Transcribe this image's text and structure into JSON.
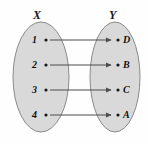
{
  "diagram": {
    "type": "mapping-diagram",
    "title": "",
    "sets": [
      {
        "id": "X",
        "label": "X",
        "side": "left",
        "elements": [
          "1",
          "2",
          "3",
          "4"
        ]
      },
      {
        "id": "Y",
        "label": "Y",
        "side": "right",
        "elements": [
          "D",
          "B",
          "C",
          "A"
        ]
      }
    ],
    "mappings": [
      {
        "from": "1",
        "to": "D"
      },
      {
        "from": "2",
        "to": "B"
      },
      {
        "from": "3",
        "to": "C"
      },
      {
        "from": "4",
        "to": "A"
      }
    ],
    "colors": {
      "background": "#fefefe",
      "ellipse_fill": "#d9d9d9",
      "ellipse_stroke": "#8a8a8a",
      "arrow": "#4d4d4d",
      "text": "#111111",
      "dot": "#1a1a1a"
    },
    "geometry": {
      "left_ellipse": {
        "cx": 41,
        "cy": 77,
        "rx": 28,
        "ry": 55
      },
      "right_ellipse": {
        "cx": 115,
        "cy": 77,
        "rx": 25,
        "ry": 55
      },
      "rows_y": [
        40,
        65,
        90,
        115
      ],
      "left_dot_x": 46,
      "right_dot_x": 117,
      "arrow_start_x": 50,
      "arrow_end_x": 111
    }
  }
}
